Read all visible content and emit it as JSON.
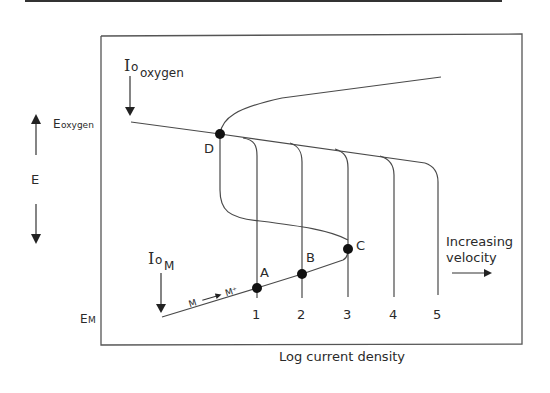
{
  "diagram": {
    "type": "mixed-potential / polarization diagram (Evans diagram)",
    "x_axis_label": "Log current density",
    "y_axis_label": "E",
    "y_markers": {
      "top": "E",
      "top_sub": "oxygen",
      "bottom": "E",
      "bottom_sub": "M"
    },
    "io_oxygen": {
      "main": "I",
      "sub0": "o",
      "sub1": "oxygen"
    },
    "io_metal": {
      "main": "I",
      "sub0": "o",
      "sub1": "M"
    },
    "reaction_label": {
      "left": "M",
      "right": "M⁺"
    },
    "points": {
      "A": "A",
      "B": "B",
      "C": "C",
      "D": "D"
    },
    "velocity_curves": [
      "1",
      "2",
      "3",
      "4",
      "5"
    ],
    "annotation": {
      "line1": "Increasing",
      "line2": "velocity"
    }
  },
  "colors": {
    "line": "#4a4a4a",
    "frame": "#555555",
    "text": "#2a2a2a",
    "dot": "#111111"
  }
}
